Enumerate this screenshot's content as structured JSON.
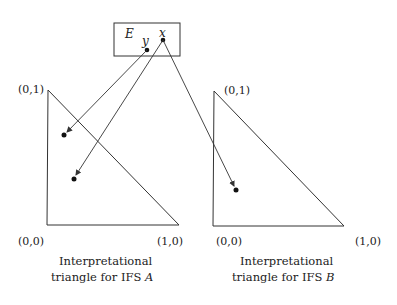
{
  "set_box": {
    "label": "E",
    "elements": [
      {
        "name": "y",
        "x": 147,
        "y": 50
      },
      {
        "name": "x",
        "x": 163,
        "y": 40
      }
    ]
  },
  "triangles": [
    {
      "id": "A",
      "labels": {
        "top": "(0,1)",
        "origin": "(0,0)",
        "right": "(1,0)"
      },
      "caption_line1": "Interpretational",
      "caption_line2_prefix": "triangle for IFS ",
      "caption_var": "A"
    },
    {
      "id": "B",
      "labels": {
        "top": "(0,1)",
        "origin": "(0,0)",
        "right": "(1,0)"
      },
      "caption_line1": "Interpretational",
      "caption_line2_prefix": "triangle for IFS ",
      "caption_var": "B"
    }
  ],
  "mappings": [
    {
      "from": "y",
      "to_triangle": "A",
      "point": [
        64,
        135
      ]
    },
    {
      "from": "x",
      "to_triangle": "A",
      "point": [
        74,
        179
      ]
    },
    {
      "from": "x",
      "to_triangle": "B",
      "point": [
        236,
        190
      ]
    }
  ]
}
